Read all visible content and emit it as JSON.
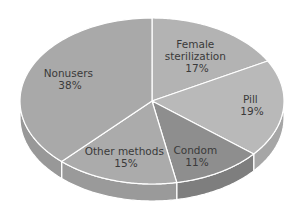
{
  "chart_data": {
    "type": "pie",
    "style": "3d",
    "title": "",
    "slices": [
      {
        "label": "Female sterilization",
        "value": 17,
        "display": [
          "Female",
          "sterilization",
          "17%"
        ],
        "color": "#b3b3b3",
        "side_color": "#a2a2a2"
      },
      {
        "label": "Pill",
        "value": 19,
        "display": [
          "Pill",
          "19%"
        ],
        "color": "#b9b9b9",
        "side_color": "#a6a6a6"
      },
      {
        "label": "Condom",
        "value": 11,
        "display": [
          "Condom",
          "11%"
        ],
        "color": "#8e8e8e",
        "side_color": "#7e7e7e"
      },
      {
        "label": "Other methods",
        "value": 15,
        "display": [
          "Other methods",
          "15%"
        ],
        "color": "#ababab",
        "side_color": "#9a9a9a"
      },
      {
        "label": "Nonusers",
        "value": 38,
        "display": [
          "Nonusers",
          "38%"
        ],
        "color": "#a9a9a9",
        "side_color": "#989898"
      }
    ],
    "start_angle_deg": 90,
    "direction": "clockwise",
    "separator_color": "#ffffff"
  }
}
